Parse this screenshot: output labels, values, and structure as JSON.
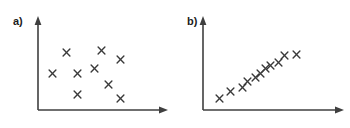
{
  "figure": {
    "background_color": "#ffffff",
    "axis_color": "#3f3f3f",
    "marker_color": "#3a3a3a",
    "marker_glyph": "x",
    "width": 350,
    "height": 128
  },
  "panels": [
    {
      "id": "a",
      "label": "a)"
    },
    {
      "id": "b",
      "label": "b)"
    }
  ],
  "chart_data": [
    {
      "type": "scatter",
      "title": "a)",
      "subtitle": "",
      "xlabel": "",
      "ylabel": "",
      "xlim": [
        0,
        10
      ],
      "ylim": [
        0,
        10
      ],
      "grid": false,
      "legend": "none",
      "axis_arrows": true,
      "tick_labels_x": [],
      "tick_labels_y": [],
      "marker": "x",
      "annotations": [],
      "description": "No correlation / random scatter",
      "points": [
        {
          "x": 2.4,
          "y": 7.2
        },
        {
          "x": 5.3,
          "y": 7.4
        },
        {
          "x": 6.9,
          "y": 6.3
        },
        {
          "x": 1.2,
          "y": 4.6
        },
        {
          "x": 3.3,
          "y": 4.6
        },
        {
          "x": 4.7,
          "y": 5.2
        },
        {
          "x": 5.9,
          "y": 3.2
        },
        {
          "x": 3.3,
          "y": 2.0
        },
        {
          "x": 6.9,
          "y": 1.5
        }
      ]
    },
    {
      "type": "scatter",
      "title": "b)",
      "subtitle": "",
      "xlabel": "",
      "ylabel": "",
      "xlim": [
        0,
        10
      ],
      "ylim": [
        0,
        10
      ],
      "grid": false,
      "legend": "none",
      "axis_arrows": true,
      "tick_labels_x": [],
      "tick_labels_y": [],
      "marker": "x",
      "annotations": [],
      "description": "Strong positive linear correlation",
      "points": [
        {
          "x": 1.3,
          "y": 1.4
        },
        {
          "x": 2.1,
          "y": 2.3
        },
        {
          "x": 3.0,
          "y": 2.8
        },
        {
          "x": 3.4,
          "y": 3.6
        },
        {
          "x": 4.0,
          "y": 4.1
        },
        {
          "x": 4.4,
          "y": 4.6
        },
        {
          "x": 4.8,
          "y": 5.2
        },
        {
          "x": 5.2,
          "y": 5.6
        },
        {
          "x": 5.8,
          "y": 6.0
        },
        {
          "x": 6.3,
          "y": 6.8
        },
        {
          "x": 7.2,
          "y": 6.9
        }
      ]
    }
  ]
}
